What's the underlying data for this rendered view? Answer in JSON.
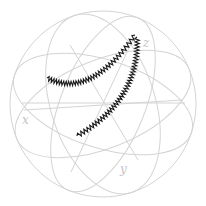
{
  "figure": {
    "type": "bloch-sphere",
    "width": 206,
    "height": 206,
    "colors": {
      "background": "#ffffff",
      "grid": "#d4d4d4",
      "label": "#c4c4c4",
      "trajectory": "#1a1a1a"
    }
  },
  "sphere": {
    "center": [
      103,
      104
    ],
    "radius": 93
  },
  "great_circles": [
    {
      "cx": 103,
      "cy": 104,
      "rx": 93,
      "ry": 93,
      "rot": 0
    },
    {
      "cx": 103,
      "cy": 104,
      "rx": 93,
      "ry": 44,
      "rot": 18
    },
    {
      "cx": 103,
      "cy": 104,
      "rx": 93,
      "ry": 44,
      "rot": -22
    },
    {
      "cx": 103,
      "cy": 104,
      "rx": 93,
      "ry": 52,
      "rot": 72
    },
    {
      "cx": 103,
      "cy": 104,
      "rx": 93,
      "ry": 42,
      "rot": 112
    }
  ],
  "equator_line": {
    "x1": 22,
    "y1": 103,
    "x2": 185,
    "y2": 103
  },
  "spokes": [
    {
      "x1": 135,
      "y1": 35,
      "x2": 71,
      "y2": 172
    },
    {
      "x1": 70,
      "y1": 45,
      "x2": 138,
      "y2": 160
    },
    {
      "x1": 24,
      "y1": 110,
      "x2": 182,
      "y2": 100
    }
  ],
  "labels": {
    "x": {
      "text": "x",
      "pos": [
        22,
        124
      ]
    },
    "y": {
      "text": "y",
      "pos": [
        120,
        173
      ]
    },
    "z": {
      "text": "z",
      "pos": [
        143,
        47
      ]
    }
  },
  "trajectories": [
    {
      "name": "trajectory-1",
      "start": [
        47,
        78
      ],
      "ctrl": [
        90,
        100
      ],
      "end": [
        135,
        35
      ],
      "amplitude": 2.2,
      "teeth": 34
    },
    {
      "name": "trajectory-2",
      "start": [
        77,
        136
      ],
      "ctrl": [
        140,
        100
      ],
      "end": [
        137,
        37
      ],
      "amplitude": 2.2,
      "teeth": 38
    }
  ]
}
